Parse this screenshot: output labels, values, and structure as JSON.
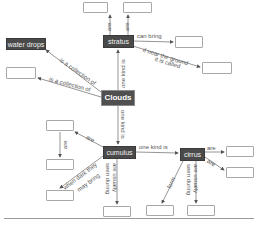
{
  "diagram": {
    "type": "concept-map",
    "central_concept": "Clouds",
    "nodes": {
      "clouds": "Clouds",
      "stratus": "stratus",
      "water_drops": "water drops",
      "cumulus": "cumulus",
      "cirrus": "cirrus",
      "blank": ""
    },
    "links": {
      "clouds_water_drops": "is a collection of",
      "clouds_blank_left": "is a collection of",
      "clouds_stratus": "one kind is",
      "clouds_cumulus": "one kind is",
      "stratus_top_left": "are",
      "stratus_top_right": "are",
      "stratus_can_bring": "can bring",
      "stratus_near_ground_1": "if near the ground",
      "stratus_near_ground_2": "it is called",
      "cumulus_are": "are",
      "cumulus_blank_down_left": "are",
      "cumulus_dark_1": "when dark they",
      "cumulus_dark_2": "may bring",
      "cumulus_seen_1": "seen during",
      "cumulus_seen_2": "are usually",
      "cumulus_cirrus": "one kind is",
      "cirrus_are_1": "are",
      "cirrus_are_2": "are",
      "cirrus_form": "form",
      "cirrus_seen_1": "seen during",
      "cirrus_seen_2": "are usually"
    }
  }
}
